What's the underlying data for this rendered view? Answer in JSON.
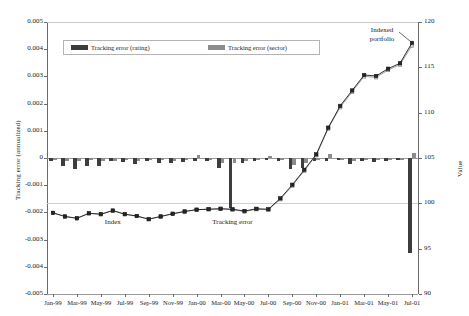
{
  "chart_data": {
    "type": "bar",
    "title": "",
    "subtitle": "",
    "xlabel": "",
    "ylabel": "Tracking error (annualized)",
    "ylabel_right": "Value",
    "grid": true,
    "legend_position": "top-center",
    "ylim": [
      -0.005,
      0.005
    ],
    "ylim_right": [
      90,
      120
    ],
    "yticks": [
      "0.005",
      "0.004",
      "0.003",
      "0.002",
      "0.001",
      "0",
      "-0.001",
      "-0.002",
      "-0.003",
      "-0.004",
      "-0.005"
    ],
    "ytick_values": [
      0.005,
      0.004,
      0.003,
      0.002,
      0.001,
      0,
      -0.001,
      -0.002,
      -0.003,
      -0.004,
      -0.005
    ],
    "yticks_right": [
      "120",
      "115",
      "110",
      "105",
      "100",
      "95",
      "90"
    ],
    "ytick_values_right": [
      120,
      115,
      110,
      105,
      100,
      95,
      90
    ],
    "xtick_labels": [
      "Jan-99",
      "Mar-99",
      "May-99",
      "Jul-99",
      "Sep-99",
      "Nov-99",
      "Jan-00",
      "Mar-00",
      "May-00",
      "Jul-00",
      "Sep-00",
      "Nov-00",
      "Jan-01",
      "Mar-01",
      "May-01",
      "Jul-01"
    ],
    "categories": [
      "Jan-99",
      "Feb-99",
      "Mar-99",
      "Apr-99",
      "May-99",
      "Jun-99",
      "Jul-99",
      "Aug-99",
      "Sep-99",
      "Oct-99",
      "Nov-99",
      "Dec-99",
      "Jan-00",
      "Feb-00",
      "Mar-00",
      "Apr-00",
      "May-00",
      "Jun-00",
      "Jul-00",
      "Aug-00",
      "Sep-00",
      "Oct-00",
      "Nov-00",
      "Dec-00",
      "Jan-01",
      "Feb-01",
      "Mar-01",
      "Apr-01",
      "May-01",
      "Jun-01",
      "Jul-01"
    ],
    "series": [
      {
        "name": "Tracking error (rating)",
        "type": "bar",
        "axis": "left",
        "color": "#3d3d3d",
        "values": [
          -0.00012,
          -0.0003,
          -0.00042,
          -0.00028,
          -0.0003,
          -0.00012,
          -0.00016,
          -0.00022,
          -0.0001,
          -0.00018,
          -0.0002,
          -0.00014,
          -0.0001,
          -0.00012,
          -0.00035,
          -0.00185,
          -0.0002,
          -0.00012,
          -8e-05,
          -0.0001,
          -0.0004,
          -0.00035,
          -0.00012,
          -0.0001,
          -8e-05,
          -0.00022,
          -0.00012,
          -0.00015,
          -0.0001,
          -8e-05,
          -0.0035
        ]
      },
      {
        "name": "Tracking error (sector)",
        "type": "bar",
        "axis": "left",
        "color": "#8c8c8c",
        "values": [
          -8e-05,
          -0.0001,
          -0.00012,
          -8e-05,
          -0.0001,
          -0.0001,
          -8e-05,
          -0.0001,
          -6e-05,
          -8e-05,
          -0.0001,
          -8e-05,
          0.00012,
          -8e-05,
          -0.0002,
          -0.00018,
          -0.0001,
          -8e-05,
          6e-05,
          -6e-05,
          -0.00025,
          -0.00018,
          -8e-05,
          0.00014,
          -8e-05,
          -0.0001,
          -8e-05,
          -8e-05,
          -6e-05,
          -6e-05,
          0.00018
        ]
      },
      {
        "name": "Index",
        "type": "line",
        "axis": "right",
        "color": "#1a1a1a",
        "marker": "square-dark",
        "values": [
          98.95,
          98.55,
          98.35,
          98.9,
          98.8,
          99.2,
          98.8,
          98.6,
          98.25,
          98.55,
          98.85,
          99.1,
          99.3,
          99.35,
          99.4,
          99.35,
          99.15,
          99.4,
          99.35,
          100.55,
          102.05,
          103.7,
          105.4,
          108.35,
          110.75,
          112.45,
          114.15,
          114.05,
          114.85,
          115.45,
          117.7
        ]
      },
      {
        "name": "Indexed portfolio",
        "type": "line",
        "axis": "right",
        "color": "#6f6f6f",
        "marker": "square-light",
        "values": [
          98.95,
          98.55,
          98.35,
          98.9,
          98.8,
          99.2,
          98.8,
          98.6,
          98.25,
          98.55,
          98.85,
          99.1,
          99.3,
          99.35,
          99.4,
          99.3,
          99.1,
          99.35,
          99.3,
          100.45,
          101.95,
          103.6,
          105.3,
          108.25,
          110.6,
          112.3,
          114.0,
          113.9,
          114.7,
          115.3,
          117.4
        ]
      }
    ],
    "annotations": [
      {
        "text": "Index",
        "x_category": "Jun-99",
        "value": -0.0024
      },
      {
        "text": "Tracking error",
        "x_category": "Apr-00",
        "value": -0.0024
      },
      {
        "text": "Indexed\nportfolio",
        "x_category": "Apr-01",
        "value": 0.0047
      }
    ]
  },
  "legend": {
    "items": [
      {
        "label": "Tracking error (rating)",
        "color": "#3d3d3d"
      },
      {
        "label": "Tracking error (sector)",
        "color": "#8c8c8c"
      }
    ]
  },
  "annotations": {
    "index": "Index",
    "tracking_error": "Tracking error",
    "indexed_portfolio_line1": "Indexed",
    "indexed_portfolio_line2": "portfolio"
  },
  "axes": {
    "left_title": "Tracking error (annualized)",
    "right_title": "Value"
  }
}
